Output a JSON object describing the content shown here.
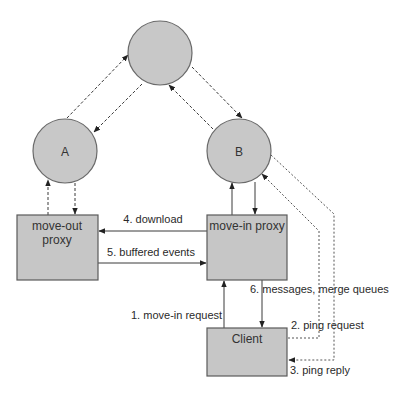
{
  "colors": {
    "node_fill": "#c8c8c8",
    "box_fill": "#c6c6c6",
    "stroke": "#3a3a3a",
    "background": "#ffffff"
  },
  "nodes": {
    "top": {
      "label": ""
    },
    "a": {
      "label": "A"
    },
    "b": {
      "label": "B"
    }
  },
  "boxes": {
    "move_out_proxy": {
      "line1": "move-out",
      "line2": "proxy"
    },
    "move_in_proxy": {
      "label": "move-in proxy"
    },
    "client": {
      "label": "Client"
    }
  },
  "edges": {
    "download": "4. download",
    "buffered_events": "5. buffered events",
    "move_in_request": "1. move-in request",
    "messages_merge_queues": "6. messages, merge queues",
    "ping_request": "2. ping request",
    "ping_reply": "3. ping reply"
  }
}
